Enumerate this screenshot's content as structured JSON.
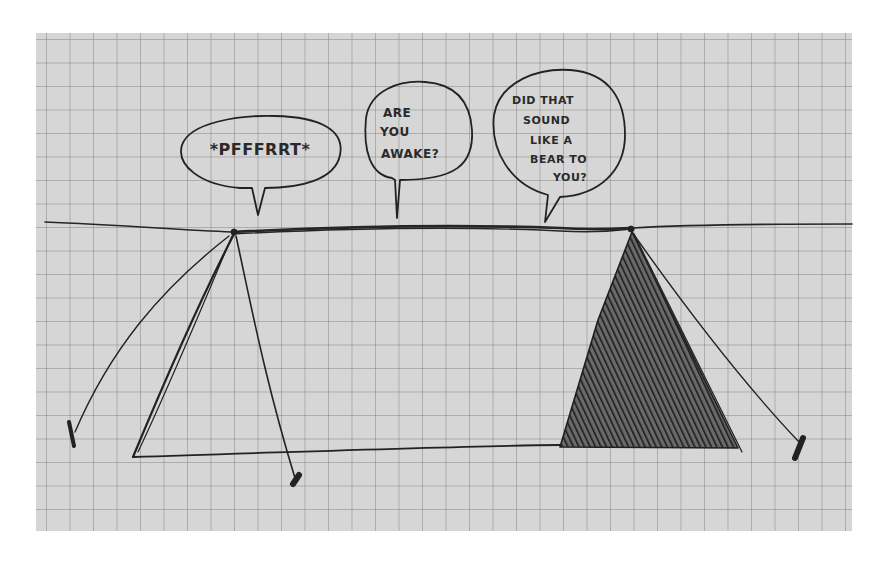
{
  "scene": {
    "description": "Hand-drawn sketch on grid paper: two tents connected by a ridge line with three speech bubbles",
    "paper_color": "#d6d6d6",
    "ink_color": "#222222"
  },
  "bubbles": [
    {
      "id": "left",
      "lines": [
        "*PFFFRRT*"
      ]
    },
    {
      "id": "middle",
      "lines": [
        "ARE",
        "YOU",
        "AWAKE?"
      ]
    },
    {
      "id": "right",
      "lines": [
        "DID THAT",
        "SOUND",
        "LIKE A",
        "BEAR TO",
        "YOU?"
      ]
    }
  ],
  "tents": [
    {
      "id": "left-tent",
      "style": "outline"
    },
    {
      "id": "right-tent",
      "style": "shaded"
    }
  ]
}
